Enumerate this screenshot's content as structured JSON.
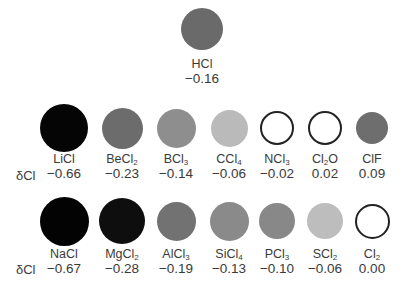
{
  "delta_label": "δCl",
  "top": {
    "name": "HCl",
    "name_main": "HCl",
    "name_sub": "",
    "value": "−0.16",
    "fill": "#6a6a6a",
    "outline": false
  },
  "row1": [
    {
      "name_main": "LiCl",
      "name_sub": "",
      "value": "−0.66",
      "fill": "#050505",
      "outline": false
    },
    {
      "name_main": "BeCl",
      "name_sub": "2",
      "value": "−0.23",
      "fill": "#6c6c6c",
      "outline": false
    },
    {
      "name_main": "BCl",
      "name_sub": "3",
      "value": "−0.14",
      "fill": "#8e8e8e",
      "outline": false
    },
    {
      "name_main": "CCl",
      "name_sub": "4",
      "value": "−0.06",
      "fill": "#bababa",
      "outline": false
    },
    {
      "name_main": "NCl",
      "name_sub": "3",
      "value": "−0.02",
      "fill": "#ffffff",
      "outline": true
    },
    {
      "name_main": "Cl",
      "name_sub": "2",
      "name_tail": "O",
      "value": "0.02",
      "fill": "#ffffff",
      "outline": true
    },
    {
      "name_main": "ClF",
      "name_sub": "",
      "value": "0.09",
      "fill": "#6e6e6e",
      "outline": false
    }
  ],
  "row2": [
    {
      "name_main": "NaCl",
      "name_sub": "",
      "value": "−0.67",
      "fill": "#030303",
      "outline": false
    },
    {
      "name_main": "MgCl",
      "name_sub": "2",
      "value": "−0.28",
      "fill": "#0e0e0e",
      "outline": false
    },
    {
      "name_main": "AlCl",
      "name_sub": "3",
      "value": "−0.19",
      "fill": "#727272",
      "outline": false
    },
    {
      "name_main": "SiCl",
      "name_sub": "4",
      "value": "−0.13",
      "fill": "#8a8a8a",
      "outline": false
    },
    {
      "name_main": "PCl",
      "name_sub": "3",
      "value": "−0.10",
      "fill": "#888888",
      "outline": false
    },
    {
      "name_main": "SCl",
      "name_sub": "2",
      "value": "−0.06",
      "fill": "#bdbdbd",
      "outline": false
    },
    {
      "name_main": "Cl",
      "name_sub": "2",
      "value": "0.00",
      "fill": "#ffffff",
      "outline": true
    }
  ]
}
